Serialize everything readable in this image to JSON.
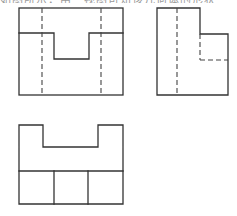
{
  "header": {
    "cropped_caption": "如图所示，由三视图可知该几何体的形状"
  },
  "figure": {
    "views": [
      {
        "name": "front-view",
        "label": "主视图",
        "hidden_lines": 2,
        "feature": "U-shaped notch in top face"
      },
      {
        "name": "side-view",
        "label": "左视图",
        "hidden_lines": 3,
        "feature": "L-shaped step profile"
      },
      {
        "name": "top-view",
        "label": "俯视图",
        "hidden_lines": 0,
        "feature": "notched top edge, bottom row split into three cells"
      }
    ],
    "line_color": "#333333",
    "background": "#ffffff"
  }
}
